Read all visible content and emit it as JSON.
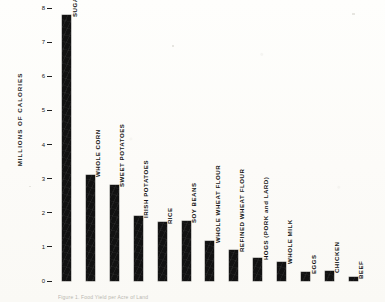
{
  "chart_data": {
    "type": "bar",
    "title": "",
    "xlabel": "",
    "ylabel": "MILLIONS OF CALORIES",
    "ylim": [
      0,
      8
    ],
    "yticks": [
      0,
      1,
      2,
      3,
      4,
      5,
      6,
      7,
      8
    ],
    "ytick_labels": [
      "0",
      "1",
      "2",
      "3",
      "4",
      "5",
      "6",
      "7",
      "8"
    ],
    "grid": false,
    "legend": "none",
    "orientation": "vertical",
    "bar_label_rotation": "vertical",
    "categories": [
      "SUGAR",
      "WHOLE CORN",
      "SWEET POTATOES",
      "IRISH POTATOES",
      "RICE",
      "SOY BEANS",
      "WHOLE WHEAT FLOUR",
      "REFINED WHEAT FLOUR",
      "HOGS (PORK and LARD)",
      "WHOLE MILK",
      "EGGS",
      "CHICKEN",
      "BEEF"
    ],
    "values": [
      7.8,
      3.1,
      2.8,
      1.9,
      1.72,
      1.75,
      1.17,
      0.9,
      0.67,
      0.55,
      0.26,
      0.29,
      0.12
    ],
    "bar_color": "#121212"
  },
  "caption": {
    "text": "Figure 1.  Food Yield per Acre of Land"
  }
}
